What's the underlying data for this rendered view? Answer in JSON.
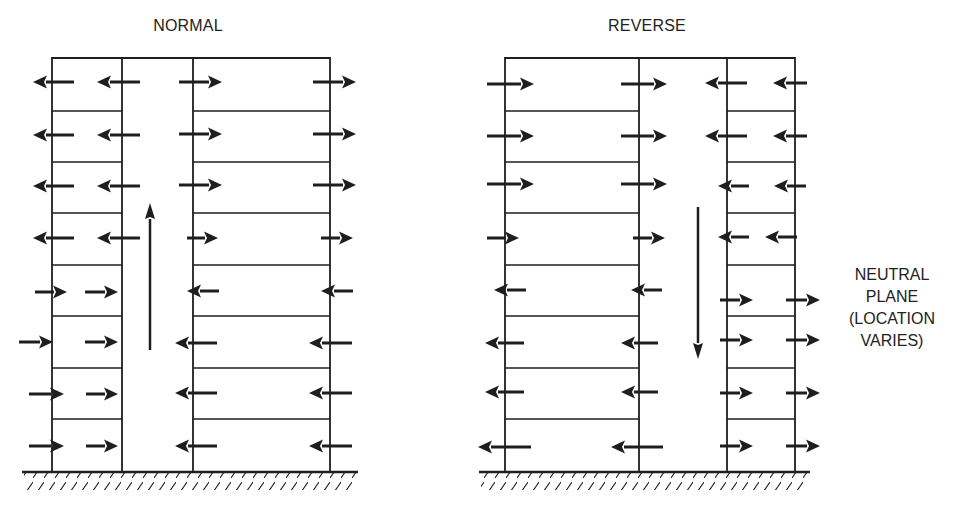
{
  "colors": {
    "stroke": "#1e1e1e",
    "background": "#ffffff",
    "text": "#222222"
  },
  "panels": [
    {
      "id": "normal",
      "title": "NORMAL",
      "title_pos": {
        "x": 188,
        "y": 17
      },
      "walls_x": {
        "outer_left": 52,
        "shaft_left": 122,
        "shaft_right": 193,
        "outer_right": 330
      },
      "top_y": 58,
      "ground_y": 472,
      "ground_x": [
        22,
        358
      ],
      "left_floors_span": [
        52,
        122
      ],
      "right_floors_span": [
        193,
        330
      ],
      "left_floor_lines_y": [
        111,
        162,
        213,
        265,
        316,
        368,
        419
      ],
      "right_floor_lines_y": [
        111,
        162,
        213,
        265,
        316,
        368,
        419
      ],
      "stack_arrow": {
        "x": 150,
        "from_y": 350,
        "to_y": 203,
        "direction": "up"
      },
      "arrows": [
        {
          "y": 82,
          "x1": 74,
          "x2": 33,
          "dir": "left"
        },
        {
          "y": 82,
          "x1": 140,
          "x2": 97,
          "dir": "left"
        },
        {
          "y": 82,
          "x1": 179,
          "x2": 222,
          "dir": "right"
        },
        {
          "y": 82,
          "x1": 313,
          "x2": 356,
          "dir": "right"
        },
        {
          "y": 135,
          "x1": 74,
          "x2": 33,
          "dir": "left"
        },
        {
          "y": 135,
          "x1": 140,
          "x2": 97,
          "dir": "left"
        },
        {
          "y": 134,
          "x1": 179,
          "x2": 222,
          "dir": "right"
        },
        {
          "y": 134,
          "x1": 313,
          "x2": 356,
          "dir": "right"
        },
        {
          "y": 186,
          "x1": 74,
          "x2": 33,
          "dir": "left"
        },
        {
          "y": 186,
          "x1": 140,
          "x2": 97,
          "dir": "left"
        },
        {
          "y": 185,
          "x1": 179,
          "x2": 222,
          "dir": "right"
        },
        {
          "y": 185,
          "x1": 313,
          "x2": 356,
          "dir": "right"
        },
        {
          "y": 238,
          "x1": 74,
          "x2": 33,
          "dir": "left"
        },
        {
          "y": 238,
          "x1": 140,
          "x2": 97,
          "dir": "left"
        },
        {
          "y": 238,
          "x1": 187,
          "x2": 218,
          "dir": "right"
        },
        {
          "y": 238,
          "x1": 321,
          "x2": 353,
          "dir": "right"
        },
        {
          "y": 292,
          "x1": 35,
          "x2": 67,
          "dir": "right"
        },
        {
          "y": 292,
          "x1": 85,
          "x2": 118,
          "dir": "right"
        },
        {
          "y": 291,
          "x1": 219,
          "x2": 187,
          "dir": "left"
        },
        {
          "y": 291,
          "x1": 353,
          "x2": 321,
          "dir": "left"
        },
        {
          "y": 342,
          "x1": 19,
          "x2": 53,
          "dir": "right"
        },
        {
          "y": 342,
          "x1": 85,
          "x2": 118,
          "dir": "right"
        },
        {
          "y": 343,
          "x1": 217,
          "x2": 175,
          "dir": "left"
        },
        {
          "y": 343,
          "x1": 352,
          "x2": 309,
          "dir": "left"
        },
        {
          "y": 394,
          "x1": 29,
          "x2": 64,
          "dir": "right"
        },
        {
          "y": 394,
          "x1": 86,
          "x2": 118,
          "dir": "right"
        },
        {
          "y": 393,
          "x1": 217,
          "x2": 175,
          "dir": "left"
        },
        {
          "y": 393,
          "x1": 352,
          "x2": 309,
          "dir": "left"
        },
        {
          "y": 446,
          "x1": 29,
          "x2": 64,
          "dir": "right"
        },
        {
          "y": 446,
          "x1": 86,
          "x2": 118,
          "dir": "right"
        },
        {
          "y": 446,
          "x1": 217,
          "x2": 175,
          "dir": "left"
        },
        {
          "y": 446,
          "x1": 352,
          "x2": 309,
          "dir": "left"
        }
      ]
    },
    {
      "id": "reverse",
      "title": "REVERSE",
      "title_pos": {
        "x": 647,
        "y": 17
      },
      "walls_x": {
        "outer_left": 505,
        "shaft_left": 639,
        "shaft_right": 727,
        "outer_right": 795
      },
      "top_y": 58,
      "ground_y": 472,
      "ground_x": [
        479,
        810
      ],
      "left_floors_span": [
        505,
        639
      ],
      "right_floors_span": [
        727,
        795
      ],
      "left_floor_lines_y": [
        111,
        162,
        213,
        265,
        316,
        368,
        419
      ],
      "right_floor_lines_y": [
        111,
        162,
        213,
        265,
        316,
        368,
        419
      ],
      "stack_arrow": {
        "x": 698,
        "from_y": 207,
        "to_y": 359,
        "direction": "down"
      },
      "arrows": [
        {
          "y": 84,
          "x1": 487,
          "x2": 534,
          "dir": "right"
        },
        {
          "y": 84,
          "x1": 621,
          "x2": 667,
          "dir": "right"
        },
        {
          "y": 83,
          "x1": 747,
          "x2": 705,
          "dir": "left"
        },
        {
          "y": 83,
          "x1": 807,
          "x2": 773,
          "dir": "left"
        },
        {
          "y": 136,
          "x1": 487,
          "x2": 534,
          "dir": "right"
        },
        {
          "y": 136,
          "x1": 621,
          "x2": 667,
          "dir": "right"
        },
        {
          "y": 136,
          "x1": 747,
          "x2": 705,
          "dir": "left"
        },
        {
          "y": 136,
          "x1": 807,
          "x2": 773,
          "dir": "left"
        },
        {
          "y": 184,
          "x1": 487,
          "x2": 534,
          "dir": "right"
        },
        {
          "y": 184,
          "x1": 621,
          "x2": 667,
          "dir": "right"
        },
        {
          "y": 186,
          "x1": 749,
          "x2": 718,
          "dir": "left"
        },
        {
          "y": 186,
          "x1": 806,
          "x2": 774,
          "dir": "left"
        },
        {
          "y": 238,
          "x1": 487,
          "x2": 519,
          "dir": "right"
        },
        {
          "y": 238,
          "x1": 633,
          "x2": 665,
          "dir": "right"
        },
        {
          "y": 237,
          "x1": 749,
          "x2": 718,
          "dir": "left"
        },
        {
          "y": 237,
          "x1": 797,
          "x2": 765,
          "dir": "left"
        },
        {
          "y": 290,
          "x1": 526,
          "x2": 494,
          "dir": "left"
        },
        {
          "y": 290,
          "x1": 662,
          "x2": 631,
          "dir": "left"
        },
        {
          "y": 300,
          "x1": 720,
          "x2": 753,
          "dir": "right"
        },
        {
          "y": 300,
          "x1": 786,
          "x2": 820,
          "dir": "right"
        },
        {
          "y": 343,
          "x1": 524,
          "x2": 485,
          "dir": "left"
        },
        {
          "y": 343,
          "x1": 658,
          "x2": 621,
          "dir": "left"
        },
        {
          "y": 340,
          "x1": 720,
          "x2": 753,
          "dir": "right"
        },
        {
          "y": 340,
          "x1": 786,
          "x2": 820,
          "dir": "right"
        },
        {
          "y": 392,
          "x1": 524,
          "x2": 485,
          "dir": "left"
        },
        {
          "y": 392,
          "x1": 658,
          "x2": 621,
          "dir": "left"
        },
        {
          "y": 393,
          "x1": 720,
          "x2": 753,
          "dir": "right"
        },
        {
          "y": 393,
          "x1": 786,
          "x2": 820,
          "dir": "right"
        },
        {
          "y": 447,
          "x1": 531,
          "x2": 478,
          "dir": "left"
        },
        {
          "y": 447,
          "x1": 663,
          "x2": 611,
          "dir": "left"
        },
        {
          "y": 446,
          "x1": 720,
          "x2": 753,
          "dir": "right"
        },
        {
          "y": 446,
          "x1": 786,
          "x2": 820,
          "dir": "right"
        }
      ]
    }
  ],
  "annotation": {
    "text": "NEUTRAL\nPLANE\n(LOCATION\nVARIES)",
    "lines": [
      "NEUTRAL",
      "PLANE",
      "(LOCATION",
      "VARIES)"
    ],
    "pos": {
      "x": 892,
      "y": 264
    }
  }
}
